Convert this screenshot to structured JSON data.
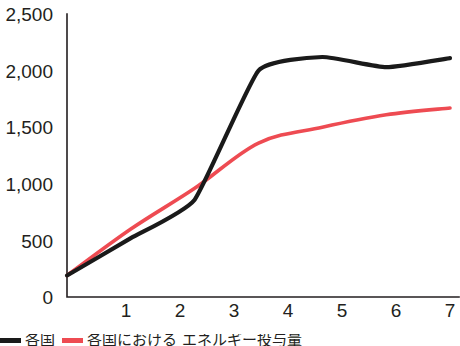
{
  "chart_data": {
    "type": "line",
    "title": "",
    "xlabel": "",
    "ylabel": "",
    "x": [
      1,
      2,
      3,
      4,
      5,
      6,
      7
    ],
    "categories": [
      "1",
      "2",
      "3",
      "4",
      "5",
      "6",
      "7"
    ],
    "xlim": [
      1,
      7
    ],
    "ylim": [
      0,
      2500
    ],
    "ytick_labels": [
      "2,500",
      "2,000",
      "1,500",
      "1,000",
      "500",
      "0"
    ],
    "ytick_values": [
      2500,
      2000,
      1500,
      1000,
      500,
      0
    ],
    "grid": false,
    "legend_position": "below-left",
    "series": [
      {
        "name": "黒色実線",
        "color": "#1a1a1a",
        "values": [
          190,
          520,
          860,
          2000,
          2120,
          2030,
          2110
        ]
      },
      {
        "name": "赤色実線",
        "color": "#ee4b52",
        "values": [
          190,
          600,
          960,
          1360,
          1500,
          1610,
          1670
        ]
      }
    ]
  },
  "legend": {
    "items": [
      {
        "label": "各国",
        "color": "#1a1a1a"
      },
      {
        "label": "総数",
        "color": "#ee4b52"
      }
    ],
    "caption": "各国における エネルギー投与量"
  },
  "colors": {
    "axis": "#231f20",
    "text": "#231f20",
    "series_black": "#1a1a1a",
    "series_red": "#ee4b52",
    "background": "#ffffff"
  }
}
